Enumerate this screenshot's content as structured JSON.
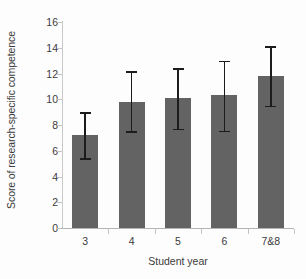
{
  "chart_data": {
    "type": "bar",
    "title": "",
    "subtitle": "",
    "xlabel": "Student year",
    "ylabel": "Score of research-specific competence",
    "categories": [
      "3",
      "4",
      "5",
      "6",
      "7&8"
    ],
    "values": [
      7.2,
      9.8,
      10.1,
      10.3,
      11.8
    ],
    "error_upper": [
      9.0,
      12.2,
      12.4,
      13.0,
      14.1
    ],
    "error_lower": [
      5.4,
      7.5,
      7.7,
      7.55,
      9.5
    ],
    "series": [
      {
        "name": "Score of research-specific competence",
        "values": [
          7.2,
          9.8,
          10.1,
          10.3,
          11.8
        ]
      }
    ],
    "ylim": [
      0,
      16
    ],
    "ytick_values": [
      0,
      2,
      4,
      6,
      8,
      10,
      12,
      14,
      16
    ],
    "ytick_labels": [
      "0",
      "2",
      "4",
      "6",
      "8",
      "10",
      "12",
      "14",
      "16"
    ],
    "grid": false,
    "legend": false,
    "legend_position": "none",
    "bar_color": "#636363",
    "errorbar_color": "#1c1c1c",
    "axis_color": "#c4c4c4",
    "text_color": "#3b3b3b",
    "background_color": "#fdfdfd",
    "annotations": []
  }
}
